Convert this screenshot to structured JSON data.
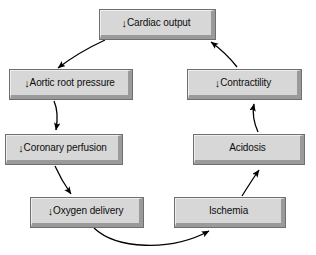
{
  "diagram": {
    "type": "flowchart-loop",
    "background_color": "#ffffff",
    "box_fill_color": "#d7d7d7",
    "box_border_color": "#6f6f6f",
    "box_shadow_color": "#9a9a9a",
    "arrow_color": "#000000",
    "down_arrow_glyph": "↓",
    "nodes": [
      {
        "id": "cardiac-output",
        "prefix": "↓",
        "label": "Cardiac output",
        "full_text": "↓Cardiac output"
      },
      {
        "id": "aortic-root-pressure",
        "prefix": "↓",
        "label": "Aortic root pressure",
        "full_text": "↓Aortic root pressure"
      },
      {
        "id": "coronary-perfusion",
        "prefix": "↓",
        "label": "Coronary perfusion",
        "full_text": "↓Coronary perfusion"
      },
      {
        "id": "oxygen-delivery",
        "prefix": "↓",
        "label": "Oxygen delivery",
        "full_text": "↓Oxygen delivery"
      },
      {
        "id": "ischemia",
        "prefix": "",
        "label": "Ischemia",
        "full_text": "Ischemia"
      },
      {
        "id": "acidosis",
        "prefix": "",
        "label": "Acidosis",
        "full_text": "Acidosis"
      },
      {
        "id": "contractility",
        "prefix": "↓",
        "label": "Contractility",
        "full_text": "↓Contractility"
      }
    ],
    "edges": [
      {
        "from": "cardiac-output",
        "to": "aortic-root-pressure"
      },
      {
        "from": "aortic-root-pressure",
        "to": "coronary-perfusion"
      },
      {
        "from": "coronary-perfusion",
        "to": "oxygen-delivery"
      },
      {
        "from": "oxygen-delivery",
        "to": "ischemia"
      },
      {
        "from": "ischemia",
        "to": "acidosis"
      },
      {
        "from": "acidosis",
        "to": "contractility"
      },
      {
        "from": "contractility",
        "to": "cardiac-output"
      }
    ]
  }
}
